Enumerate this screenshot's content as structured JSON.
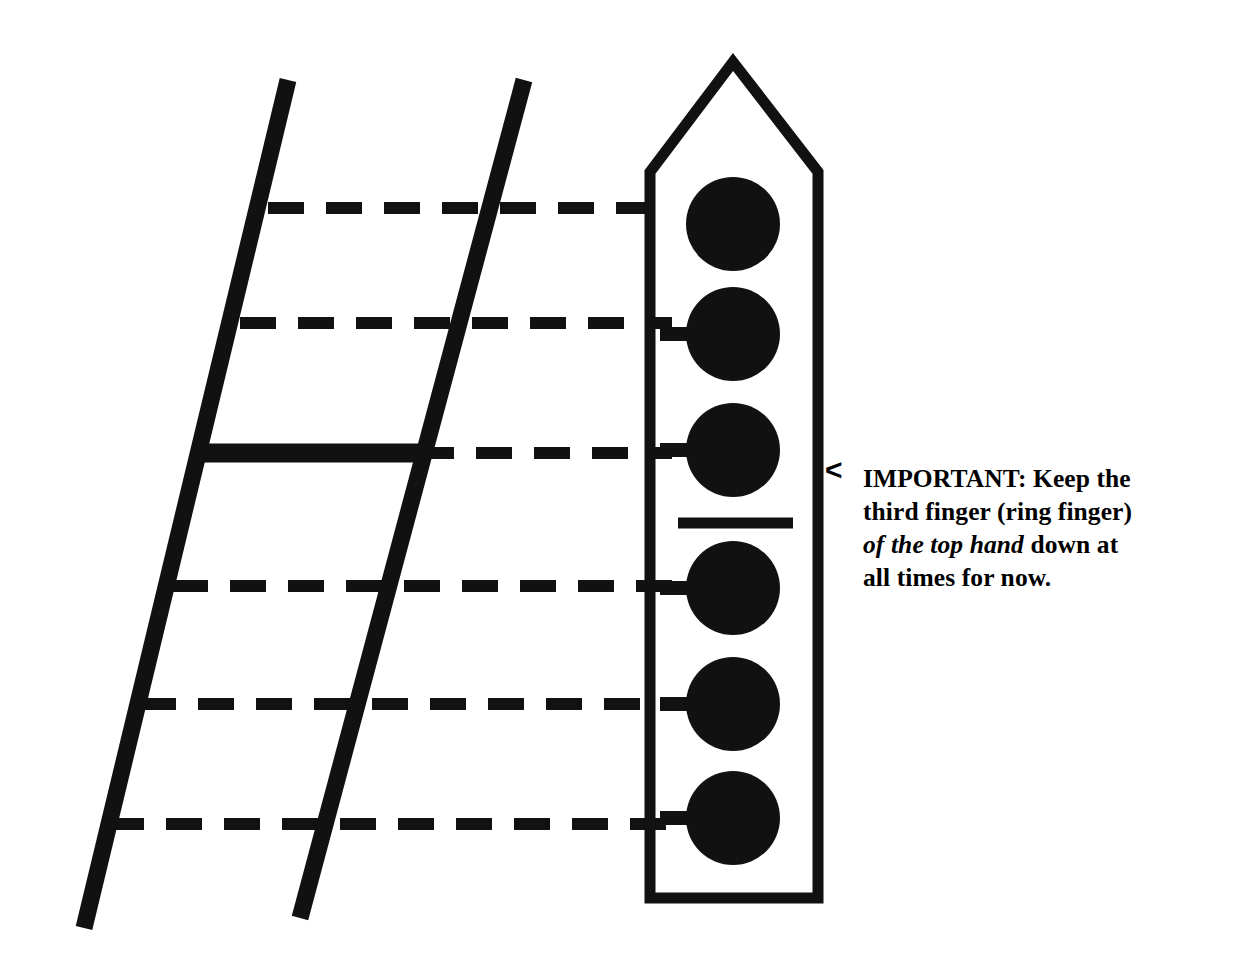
{
  "figure": {
    "kind": "guitar-fretboard-slide-position-diagram",
    "ink_color": "#111111",
    "background_color": "#ffffff",
    "strings": [
      {
        "name": "string-rail-left",
        "x1": 288,
        "y1": 80,
        "x2": 84,
        "y2": 928,
        "width": 17
      },
      {
        "name": "string-rail-right",
        "x1": 524,
        "y1": 80,
        "x2": 300,
        "y2": 918,
        "width": 17
      }
    ],
    "frets": [
      {
        "index": 1,
        "y": 208,
        "style": "dashed",
        "x_start": 268,
        "x_end": 672
      },
      {
        "index": 2,
        "y": 323,
        "style": "dashed",
        "x_start": 240,
        "x_end": 672
      },
      {
        "index": 3,
        "y": 453,
        "style": "solid-then-dashed",
        "solid_x_start": 200,
        "solid_x_end": 418,
        "dashed_x_end": 672
      },
      {
        "index": 4,
        "y": 586,
        "style": "dashed",
        "x_start": 172,
        "x_end": 672
      },
      {
        "index": 5,
        "y": 704,
        "style": "dashed",
        "x_start": 140,
        "x_end": 672
      },
      {
        "index": 6,
        "y": 824,
        "style": "dashed",
        "x_start": 108,
        "x_end": 672
      }
    ],
    "dash_pattern": {
      "dash": 36,
      "gap": 22,
      "thickness": 12
    },
    "nut_block": {
      "name": "tuner-head-outline",
      "apex": {
        "x": 733,
        "y": 62
      },
      "shoulder_y": 172,
      "left_x": 650,
      "right_x": 818,
      "bottom_y": 898,
      "stroke_width": 11
    },
    "tuning_pegs": [
      {
        "index": 1,
        "cx": 733,
        "cy": 224,
        "r": 47,
        "has_stem": false
      },
      {
        "index": 2,
        "cx": 733,
        "cy": 334,
        "r": 47,
        "has_stem": true
      },
      {
        "index": 3,
        "cx": 733,
        "cy": 450,
        "r": 47,
        "has_stem": true
      },
      {
        "index": 4,
        "cx": 733,
        "cy": 588,
        "r": 47,
        "has_stem": true
      },
      {
        "index": 5,
        "cx": 733,
        "cy": 704,
        "r": 47,
        "has_stem": true
      },
      {
        "index": 6,
        "cx": 733,
        "cy": 818,
        "r": 47,
        "has_stem": true
      }
    ],
    "barre_line": {
      "name": "barre-marker",
      "x_start": 678,
      "x_end": 793,
      "y": 523,
      "thickness": 11
    }
  },
  "callout": {
    "arrow_glyph": "<",
    "arrow_name": "left-pointing-arrow",
    "line1": "IMPORTANT: Keep the",
    "line2": "third finger (ring finger)",
    "emphasis": "of the top hand",
    "line3_tail": " down at",
    "line4": "all times for now."
  }
}
